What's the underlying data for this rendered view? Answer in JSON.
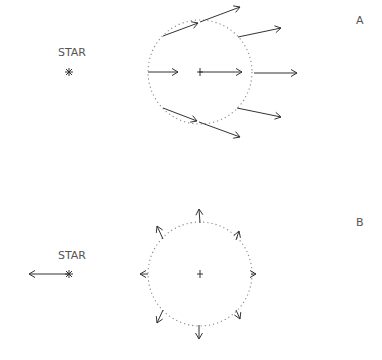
{
  "panels": [
    {
      "id": "A",
      "label": "A",
      "star_label": "STAR",
      "star": {
        "x": 69,
        "y": 72
      },
      "star_arrow": null,
      "circle": {
        "cx": 200,
        "cy": 72,
        "r": 52
      },
      "center_marker": "plus",
      "arrows": [
        {
          "x1": 163,
          "y1": 36,
          "x2": 198,
          "y2": 23
        },
        {
          "x1": 200,
          "y1": 22,
          "x2": 240,
          "y2": 7
        },
        {
          "x1": 238,
          "y1": 37,
          "x2": 281,
          "y2": 28
        },
        {
          "x1": 148,
          "y1": 72,
          "x2": 178,
          "y2": 72
        },
        {
          "x1": 199,
          "y1": 72,
          "x2": 242,
          "y2": 72
        },
        {
          "x1": 254,
          "y1": 73,
          "x2": 297,
          "y2": 73
        },
        {
          "x1": 163,
          "y1": 108,
          "x2": 197,
          "y2": 121
        },
        {
          "x1": 199,
          "y1": 122,
          "x2": 240,
          "y2": 137
        },
        {
          "x1": 237,
          "y1": 108,
          "x2": 281,
          "y2": 117
        }
      ],
      "description": "Tidal field seen in frame of star: uniform acceleration toward +x plus differential"
    },
    {
      "id": "B",
      "label": "B",
      "star_label": "STAR",
      "star": {
        "x": 69,
        "y": 274
      },
      "star_arrow": {
        "x1": 69,
        "y1": 274,
        "x2": 29,
        "y2": 274
      },
      "circle": {
        "cx": 200,
        "cy": 274,
        "r": 52
      },
      "center_marker": "plus",
      "arrows": [
        {
          "x1": 200,
          "y1": 223,
          "x2": 199,
          "y2": 209
        },
        {
          "x1": 163,
          "y1": 239,
          "x2": 157,
          "y2": 226
        },
        {
          "x1": 236,
          "y1": 240,
          "x2": 239,
          "y2": 231
        },
        {
          "x1": 148,
          "y1": 274,
          "x2": 140,
          "y2": 274
        },
        {
          "x1": 251,
          "y1": 274,
          "x2": 256,
          "y2": 274
        },
        {
          "x1": 163,
          "y1": 310,
          "x2": 157,
          "y2": 323
        },
        {
          "x1": 236,
          "y1": 310,
          "x2": 240,
          "y2": 319
        },
        {
          "x1": 199,
          "y1": 325,
          "x2": 199,
          "y2": 339
        }
      ],
      "description": "Residual tidal accelerations after subtracting center acceleration"
    }
  ],
  "colors": {
    "arrow": "#333333",
    "circle": "#888888",
    "label": "#555555",
    "background": "#ffffff"
  }
}
